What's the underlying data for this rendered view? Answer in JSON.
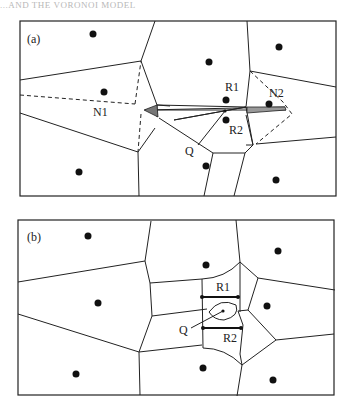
{
  "header_fragment": "...AND THE VORONOI MODEL",
  "panels": [
    {
      "id": "a",
      "label": "(a)",
      "labels": {
        "n1": "N1",
        "n2": "N2",
        "r1": "R1",
        "r2": "R2",
        "q": "Q"
      },
      "sites": [
        [
          93,
          34
        ],
        [
          104,
          92
        ],
        [
          79,
          172
        ],
        [
          209,
          62
        ],
        [
          279,
          46
        ],
        [
          226,
          101
        ],
        [
          226,
          121
        ],
        [
          266,
          104
        ],
        [
          206,
          166
        ],
        [
          276,
          180
        ]
      ],
      "description": "Voronoi diagram with query point Q inside a thin wedge; dashed lines to neighbors N1 and N2; shaded triangles at wedge ends"
    },
    {
      "id": "b",
      "label": "(b)",
      "labels": {
        "r1": "R1",
        "r2": "R2",
        "q": "Q"
      },
      "sites": [
        [
          88,
          236
        ],
        [
          98,
          303
        ],
        [
          76,
          374
        ],
        [
          207,
          265
        ],
        [
          277,
          251
        ],
        [
          267,
          306
        ],
        [
          203,
          369
        ],
        [
          273,
          380
        ]
      ],
      "description": "Modified Voronoi diagram with Q region bounded by curved edges and bold segments R1, R2"
    }
  ]
}
